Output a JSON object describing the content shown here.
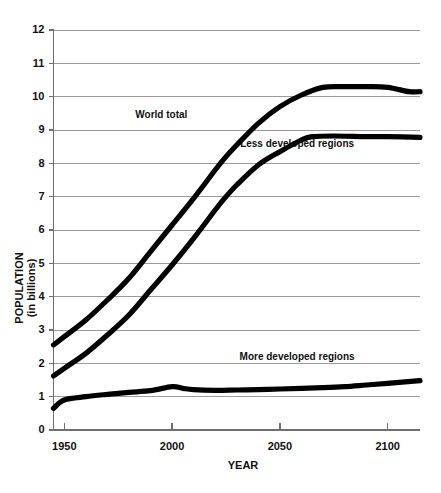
{
  "chart_data": {
    "type": "line",
    "title": "",
    "xlabel": "YEAR",
    "ylabel_line1": "POPULATION",
    "ylabel_line2": "(in billions)",
    "xlim": [
      1945,
      2115
    ],
    "ylim": [
      0,
      12
    ],
    "grid": true,
    "legend_position": "inline-annotations",
    "x_ticks": [
      "1950",
      "2000",
      "2050",
      "2100"
    ],
    "x_tick_values": [
      1950,
      2000,
      2050,
      2100
    ],
    "y_ticks": [
      "0",
      "1",
      "2",
      "3",
      "4",
      "5",
      "6",
      "7",
      "8",
      "9",
      "10",
      "11",
      "12"
    ],
    "y_tick_values": [
      0,
      1,
      2,
      3,
      4,
      5,
      6,
      7,
      8,
      9,
      10,
      11,
      12
    ],
    "series": [
      {
        "name": "World total",
        "label": "World total",
        "color": "#000000",
        "x": [
          1945,
          1950,
          1960,
          1970,
          1980,
          1990,
          2000,
          2010,
          2020,
          2025,
          2030,
          2040,
          2050,
          2060,
          2070,
          2080,
          2090,
          2100,
          2110,
          2115
        ],
        "values": [
          2.55,
          2.8,
          3.3,
          3.9,
          4.55,
          5.35,
          6.15,
          6.95,
          7.8,
          8.2,
          8.55,
          9.2,
          9.7,
          10.05,
          10.28,
          10.3,
          10.3,
          10.28,
          10.15,
          10.15
        ]
      },
      {
        "name": "Less developed regions",
        "label": "Less developed regions",
        "color": "#000000",
        "x": [
          1945,
          1950,
          1960,
          1970,
          1980,
          1990,
          2000,
          2010,
          2020,
          2025,
          2030,
          2040,
          2050,
          2060,
          2065,
          2075,
          2090,
          2100,
          2115
        ],
        "values": [
          1.62,
          1.85,
          2.3,
          2.85,
          3.45,
          4.2,
          4.95,
          5.75,
          6.6,
          7.0,
          7.35,
          7.95,
          8.35,
          8.7,
          8.8,
          8.82,
          8.8,
          8.8,
          8.78
        ]
      },
      {
        "name": "More developed regions",
        "label": "More developed regions",
        "color": "#000000",
        "x": [
          1945,
          1950,
          1960,
          1970,
          1980,
          1990,
          2000,
          2005,
          2010,
          2020,
          2030,
          2040,
          2050,
          2060,
          2070,
          2080,
          2090,
          2100,
          2115
        ],
        "values": [
          0.65,
          0.9,
          1.0,
          1.07,
          1.13,
          1.18,
          1.3,
          1.25,
          1.21,
          1.19,
          1.2,
          1.21,
          1.23,
          1.25,
          1.27,
          1.3,
          1.35,
          1.4,
          1.48
        ]
      }
    ],
    "annotations": [
      {
        "text": "World total",
        "x": 1995,
        "y": 9.35
      },
      {
        "text": "Less developed regions",
        "x": 2058,
        "y": 8.5
      },
      {
        "text": "More developed regions",
        "x": 2058,
        "y": 2.1
      }
    ]
  }
}
